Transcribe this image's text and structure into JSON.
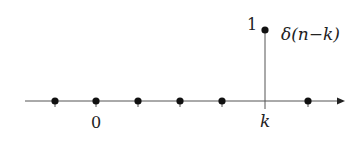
{
  "diagram": {
    "type": "discrete-time unit impulse (shifted)",
    "function_label": "δ(n−k)",
    "amplitude_label": "1",
    "x_labels": {
      "origin": "0",
      "shift": "k"
    },
    "samples": [
      {
        "x": 55,
        "value": 0
      },
      {
        "x": 96,
        "value": 0
      },
      {
        "x": 138,
        "value": 0
      },
      {
        "x": 180,
        "value": 0
      },
      {
        "x": 222,
        "value": 0
      },
      {
        "x": 265,
        "value": 1
      },
      {
        "x": 308,
        "value": 0
      }
    ],
    "colors": {
      "stroke": "#222222",
      "line": "#555555"
    }
  }
}
